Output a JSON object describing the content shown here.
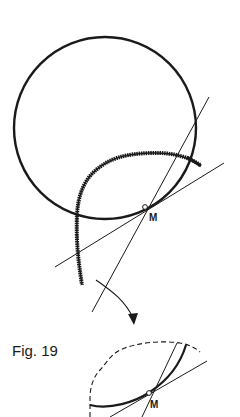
{
  "figure": {
    "caption": "Fig. 19",
    "point_label_top": "M",
    "point_label_bottom": "M"
  },
  "colors": {
    "ink": "#1a1a1a",
    "background": "#ffffff"
  },
  "elements": {
    "main_circle": {
      "cx": 105,
      "cy": 128,
      "r": 91
    },
    "tangent_point_top": {
      "x": 145,
      "y": 207
    },
    "tangent_point_bottom": {
      "x": 149,
      "y": 393
    }
  }
}
